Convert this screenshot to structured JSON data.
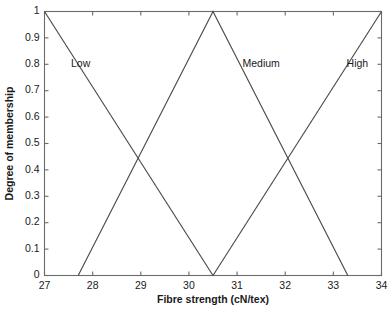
{
  "chart_data": {
    "type": "line",
    "title": "",
    "subtitle": "",
    "xlabel": "Fibre strength (cN/tex)",
    "ylabel": "Degree of membership",
    "xlim": [
      27,
      34
    ],
    "ylim": [
      0,
      1
    ],
    "grid": false,
    "legend_position": "inline-annotations",
    "xticks": [
      27,
      28,
      29,
      30,
      31,
      32,
      33,
      34
    ],
    "xtick_labels": [
      "27",
      "28",
      "29",
      "30",
      "31",
      "32",
      "33",
      "34"
    ],
    "yticks": [
      0,
      0.1,
      0.2,
      0.3,
      0.4,
      0.5,
      0.6,
      0.7,
      0.8,
      0.9,
      1
    ],
    "ytick_labels": [
      "0",
      "0.1",
      "0.2",
      "0.3",
      "0.4",
      "0.5",
      "0.6",
      "0.7",
      "0.8",
      "0.9",
      "1"
    ],
    "series": [
      {
        "name": "Low",
        "x": [
          27,
          30.5
        ],
        "values": [
          1,
          0
        ],
        "label": "Low",
        "label_x": 27.75,
        "label_y": 0.8,
        "color": "#4a4a4a"
      },
      {
        "name": "Medium",
        "x": [
          27.7,
          30.5,
          33.3
        ],
        "values": [
          0,
          1,
          0
        ],
        "label": "Medium",
        "label_x": 31.5,
        "label_y": 0.8,
        "color": "#4a4a4a"
      },
      {
        "name": "High",
        "x": [
          30.5,
          34
        ],
        "values": [
          0,
          1
        ],
        "label": "High",
        "label_x": 33.5,
        "label_y": 0.8,
        "color": "#4a4a4a"
      }
    ],
    "annotations": [
      {
        "text": "Low",
        "x": 27.75,
        "y": 0.8
      },
      {
        "text": "Medium",
        "x": 31.5,
        "y": 0.8
      },
      {
        "text": "High",
        "x": 33.5,
        "y": 0.8
      }
    ],
    "crossings": [
      {
        "x": 29.1,
        "y": 0.5,
        "between": "Low-Medium"
      },
      {
        "x": 31.9,
        "y": 0.5,
        "between": "Medium-High"
      }
    ]
  }
}
